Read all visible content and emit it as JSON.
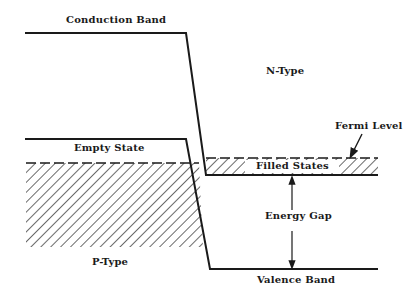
{
  "diagram": {
    "labels": {
      "conduction_band": "Conduction Band",
      "n_type": "N-Type",
      "fermi_level": "Fermi Level",
      "empty_state": "Empty State",
      "filled_states": "Filled States",
      "energy_gap": "Energy Gap",
      "p_type": "P-Type",
      "valence_band": "Valence Band"
    },
    "colors": {
      "line": "#1a1a1a",
      "background": "#ffffff"
    }
  }
}
